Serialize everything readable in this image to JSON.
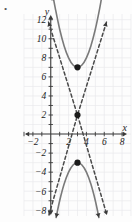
{
  "figure": {
    "name": "coordinate-plane-graph",
    "bullet_marker": "•",
    "axis_labels": {
      "x": "x",
      "y": "y"
    },
    "colors": {
      "grid": "#e9e9ed",
      "axis": "#3a3a3a",
      "curve": "#7a7a7a",
      "dashed": "#4a4a4a",
      "point": "#1a1a1a",
      "background": "#fdfdfd"
    },
    "x_ticks": [
      {
        "value": -2,
        "label": "−2"
      },
      {
        "value": 2,
        "label": "2"
      },
      {
        "value": 4,
        "label": "4"
      },
      {
        "value": 6,
        "label": "6"
      },
      {
        "value": 8,
        "label": "8"
      }
    ],
    "y_ticks": [
      {
        "value": 12,
        "label": "12"
      },
      {
        "value": 10,
        "label": "10"
      },
      {
        "value": 8,
        "label": "8"
      },
      {
        "value": 6,
        "label": "6"
      },
      {
        "value": 4,
        "label": "4"
      },
      {
        "value": 2,
        "label": "2"
      },
      {
        "value": -2,
        "label": "−2"
      },
      {
        "value": -4,
        "label": "−4"
      },
      {
        "value": -6,
        "label": "−6"
      },
      {
        "value": -8,
        "label": "−8"
      }
    ]
  },
  "chart_data": {
    "type": "line",
    "title": "",
    "xlabel": "x",
    "ylabel": "y",
    "xlim": [
      -3,
      9
    ],
    "ylim": [
      -8.6,
      12.6
    ],
    "grid": true,
    "legend": null,
    "x_ticks": [
      -2,
      2,
      4,
      6,
      8
    ],
    "y_ticks": [
      -8,
      -6,
      -4,
      -2,
      2,
      4,
      6,
      8,
      10,
      12
    ],
    "series": [
      {
        "name": "upward-parabola",
        "style": "solid",
        "color": "#7a7a7a",
        "vertex": [
          3,
          7
        ],
        "equation": "y = (x - 3)^2 + 7",
        "arrows": [
          "end"
        ],
        "points": [
          [
            0.25,
            14.5
          ],
          [
            0.5,
            13.25
          ],
          [
            1,
            11
          ],
          [
            1.5,
            9.25
          ],
          [
            2,
            8
          ],
          [
            2.5,
            7.25
          ],
          [
            3,
            7
          ],
          [
            3.5,
            7.25
          ],
          [
            4,
            8
          ],
          [
            4.5,
            9.25
          ],
          [
            5,
            11
          ],
          [
            5.5,
            13.25
          ],
          [
            5.75,
            14.6
          ]
        ]
      },
      {
        "name": "downward-parabola",
        "style": "solid",
        "color": "#7a7a7a",
        "vertex": [
          3,
          -3
        ],
        "equation": "y = -(x - 3)^2 - 3",
        "arrows": [
          "none"
        ],
        "points": [
          [
            0.6,
            -8.76
          ],
          [
            1,
            -7
          ],
          [
            1.5,
            -5.25
          ],
          [
            2,
            -4
          ],
          [
            2.5,
            -3.25
          ],
          [
            3,
            -3
          ],
          [
            3.5,
            -3.25
          ],
          [
            4,
            -4
          ],
          [
            4.5,
            -5.25
          ],
          [
            5,
            -7
          ],
          [
            5.4,
            -8.76
          ]
        ]
      },
      {
        "name": "dashed-v-upper",
        "style": "dashed",
        "color": "#4a4a4a",
        "vertex": [
          3,
          2
        ],
        "equation": "y = 3|x - 3| + 2",
        "arrows": [
          "start",
          "end"
        ],
        "points": [
          [
            -0.25,
            11.75
          ],
          [
            3,
            2
          ],
          [
            6.25,
            11.75
          ]
        ]
      },
      {
        "name": "dashed-v-lower",
        "style": "dashed",
        "color": "#4a4a4a",
        "vertex": [
          3,
          2
        ],
        "equation": "y = -3|x - 3| + 2 (inverted wedge)",
        "arrows": [
          "start",
          "end"
        ],
        "points": [
          [
            -0.2,
            -8.5
          ],
          [
            3,
            2
          ],
          [
            6.3,
            -8.5
          ]
        ]
      }
    ],
    "marked_points": [
      {
        "name": "upper-parabola-vertex",
        "x": 3,
        "y": 7
      },
      {
        "name": "dashed-lines-intersection",
        "x": 3,
        "y": 2
      },
      {
        "name": "lower-parabola-vertex",
        "x": 3,
        "y": -3
      }
    ]
  }
}
